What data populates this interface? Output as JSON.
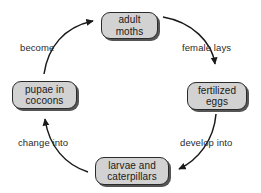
{
  "diagram": {
    "direction": "clockwise",
    "colors": {
      "node_fill": "#d2d2d2",
      "node_border": "#2b2b2b",
      "node_shadow": "#555555",
      "arrow": "#1a1a1a",
      "text": "#1a1a1a",
      "background": "#ffffff"
    },
    "nodes": [
      {
        "id": "adult-moths",
        "label": "adult moths",
        "line1": "adult",
        "line2": "moths",
        "position": "top"
      },
      {
        "id": "fertilized-eggs",
        "label": "fertilized eggs",
        "line1": "fertilized",
        "line2": "eggs",
        "position": "right"
      },
      {
        "id": "larvae-and-caterpillars",
        "label": "larvae and caterpillars",
        "line1": "larvae and",
        "line2": "caterpillars",
        "position": "bottom"
      },
      {
        "id": "pupae-in-cocoons",
        "label": "pupae in cocoons",
        "line1": "pupae in",
        "line2": "cocoons",
        "position": "left"
      }
    ],
    "edges": [
      {
        "id": "female-lays",
        "label": "female lays",
        "from": "adult-moths",
        "to": "fertilized-eggs",
        "arrowhead": "down"
      },
      {
        "id": "develop-into",
        "label": "develop into",
        "from": "fertilized-eggs",
        "to": "larvae-and-caterpillars",
        "arrowhead": "left"
      },
      {
        "id": "change-into",
        "label": "change into",
        "from": "larvae-and-caterpillars",
        "to": "pupae-in-cocoons",
        "arrowhead": "up"
      },
      {
        "id": "become",
        "label": "become",
        "from": "pupae-in-cocoons",
        "to": "adult-moths",
        "arrowhead": "right"
      }
    ]
  }
}
